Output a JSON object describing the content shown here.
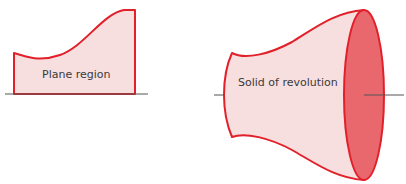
{
  "diagram": {
    "plane_region": {
      "label": "Plane region"
    },
    "solid": {
      "label": "Solid of revolution"
    }
  },
  "colors": {
    "outline": "#e2202a",
    "fill_light": "#f7dfe0",
    "fill_face": "#e8686e",
    "axis": "#555555"
  }
}
